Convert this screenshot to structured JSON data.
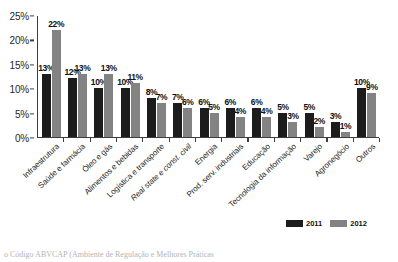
{
  "figure": {
    "clipped_title": "",
    "clipped_caption": "o Código ABVCAP (Ambiente de Regulação e Melhores Práticas"
  },
  "legend": {
    "position": "bottom-right",
    "entries": [
      {
        "label": "2011",
        "color": "#1c1c1c"
      },
      {
        "label": "2012",
        "color": "#838383"
      }
    ]
  },
  "chart_data": {
    "type": "bar",
    "title": "",
    "xlabel": "",
    "ylabel": "",
    "ylim": [
      0,
      25
    ],
    "ytick_labels": [
      "0%",
      "5%",
      "10%",
      "15%",
      "20%",
      "25%"
    ],
    "ytick_values": [
      0,
      5,
      10,
      15,
      20,
      25
    ],
    "grid": false,
    "legend_position": "bottom-right",
    "categories": [
      "Infraestrutura",
      "Saúde e farmácia",
      "Óleo e gás",
      "Alimentos e bebidas",
      "Logística e transporte",
      "Real state e const. civil",
      "Energia",
      "Prod. serv. industriais",
      "Educação",
      "Tecnologia da informação",
      "Varejo",
      "Agronegócio",
      "Outros"
    ],
    "series": [
      {
        "name": "2011",
        "color": "#1c1c1c",
        "values": [
          13,
          12,
          10,
          10,
          8,
          7,
          6,
          6,
          6,
          5,
          5,
          3,
          10
        ],
        "labels": [
          "13%",
          "12%",
          "10%",
          "10%",
          "8%",
          "7%",
          "6%",
          "6%",
          "6%",
          "5%",
          "5%",
          "3%",
          "10%"
        ]
      },
      {
        "name": "2012",
        "color": "#838383",
        "values": [
          22,
          13,
          13,
          11,
          7,
          6,
          5,
          4,
          4,
          3,
          2,
          1,
          9
        ],
        "labels": [
          "22%",
          "13%",
          "13%",
          "11%",
          "7%",
          "6%",
          "5%",
          "4%",
          "4%",
          "3%",
          "2%",
          "1%",
          "9%"
        ]
      }
    ]
  }
}
